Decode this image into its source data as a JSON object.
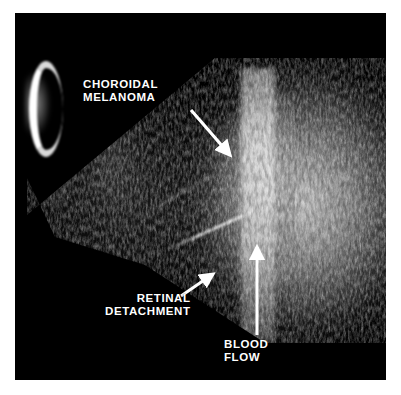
{
  "image": {
    "modality": "b-scan-ocular-ultrasound",
    "background_color": "#ffffff",
    "panel_color": "#000000",
    "annotation_color": "#ffffff"
  },
  "annotations": [
    {
      "id": "choroidal-melanoma",
      "label": "CHOROIDAL\nMELANOMA",
      "line1": "CHOROIDAL",
      "line2": "MELANOMA",
      "arrow": {
        "from_x": 176,
        "from_y": 97,
        "to_x": 218,
        "to_y": 145
      }
    },
    {
      "id": "retinal-detachment",
      "label": "RETINAL\nDETACHMENT",
      "line1": "RETINAL",
      "line2": "DETACHMENT",
      "arrow": {
        "from_x": 166,
        "from_y": 283,
        "to_x": 201,
        "to_y": 259
      }
    },
    {
      "id": "blood-flow",
      "label": "BLOOD\nFLOW",
      "line1": "BLOOD",
      "line2": "FLOW",
      "arrow": {
        "from_x": 242,
        "from_y": 322,
        "to_x": 242,
        "to_y": 230
      }
    }
  ],
  "structures": [
    {
      "name": "corneal-apex-arc",
      "description": "bright white crescent at probe apex"
    },
    {
      "name": "vitreous-cavity",
      "description": "anechoic dark central region"
    },
    {
      "name": "tumor-mass",
      "description": "dome-shaped echogenic mass at posterior wall"
    },
    {
      "name": "blood-flow-column",
      "description": "bright vertical vascular column within mass"
    },
    {
      "name": "retinal-detachment-membrane",
      "description": "thin bright linear membrane"
    }
  ]
}
